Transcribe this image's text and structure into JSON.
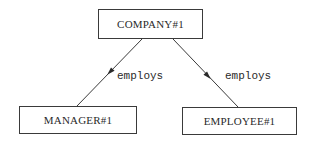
{
  "diagram": {
    "type": "entity-relationship",
    "nodes": [
      {
        "id": "company",
        "label": "COMPANY#1",
        "x": 98,
        "y": 9,
        "w": 105,
        "h": 30
      },
      {
        "id": "manager",
        "label": "MANAGER#1",
        "x": 19,
        "y": 106,
        "w": 118,
        "h": 28
      },
      {
        "id": "employee",
        "label": "EMPLOYEE#1",
        "x": 182,
        "y": 107,
        "w": 115,
        "h": 28
      }
    ],
    "edges": [
      {
        "from": "company",
        "to": "manager",
        "label": "employs",
        "x1": 142,
        "y1": 39,
        "x2": 77,
        "y2": 106,
        "arrow_x": 110,
        "arrow_y": 72,
        "label_x": 117,
        "label_y": 71
      },
      {
        "from": "company",
        "to": "employee",
        "label": "employs",
        "x1": 173,
        "y1": 39,
        "x2": 238,
        "y2": 107,
        "arrow_x": 208,
        "arrow_y": 76,
        "label_x": 225,
        "label_y": 71
      }
    ],
    "colors": {
      "stroke": "#3a3a3a",
      "text": "#2a2a2a",
      "background": "#ffffff"
    }
  }
}
